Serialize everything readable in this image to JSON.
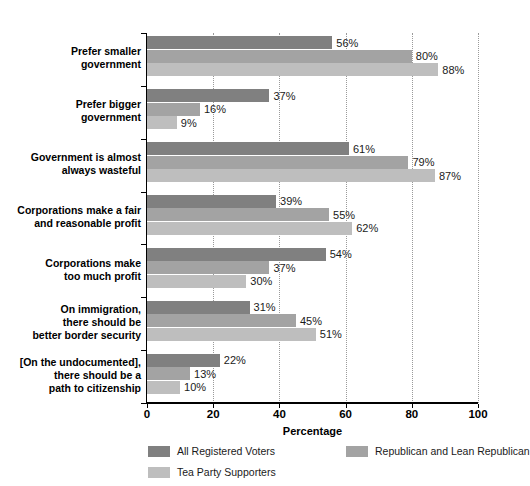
{
  "chart_data": {
    "type": "bar",
    "orientation": "horizontal",
    "grouped": true,
    "title": "",
    "xlabel": "Percentage",
    "ylabel": "",
    "xlim": [
      0,
      100
    ],
    "xticks": [
      0,
      20,
      40,
      60,
      80,
      100
    ],
    "grid": "vertical-dotted",
    "legend_position": "bottom",
    "value_label_suffix": "%",
    "categories": [
      "Prefer smaller government",
      "Prefer bigger government",
      "Government is almost always wasteful",
      "Corporations make a fair and reasonable profit",
      "Corporations make too much profit",
      "On immigration, there should be better border security",
      "[On the undocumented], there should be a path to citizenship"
    ],
    "category_lines": [
      [
        "Prefer smaller",
        "government"
      ],
      [
        "Prefer bigger",
        "government"
      ],
      [
        "Government is almost",
        "always wasteful"
      ],
      [
        "Corporations make a fair",
        "and reasonable profit"
      ],
      [
        "Corporations make",
        "too much profit"
      ],
      [
        "On immigration,",
        "there should be",
        "better border security"
      ],
      [
        "[On the undocumented],",
        "there should be a",
        "path to citizenship"
      ]
    ],
    "series": [
      {
        "name": "All Registered Voters",
        "color": "#808080",
        "values": [
          56,
          37,
          61,
          39,
          54,
          31,
          22
        ],
        "labels": [
          "56%",
          "37%",
          "61%",
          "39%",
          "54%",
          "31%",
          "22%"
        ]
      },
      {
        "name": "Republican and Lean Republican",
        "color": "#a3a3a3",
        "values": [
          80,
          16,
          79,
          55,
          37,
          45,
          13
        ],
        "labels": [
          "80%",
          "16%",
          "79%",
          "55%",
          "37%",
          "45%",
          "13%"
        ]
      },
      {
        "name": "Tea Party Supporters",
        "color": "#bebebe",
        "values": [
          88,
          9,
          87,
          62,
          30,
          51,
          10
        ],
        "labels": [
          "88%",
          "9%",
          "87%",
          "62%",
          "30%",
          "51%",
          "10%"
        ]
      }
    ]
  },
  "axis": {
    "tick_labels": [
      "0",
      "20",
      "40",
      "60",
      "80",
      "100"
    ],
    "title": "Percentage"
  },
  "legend": {
    "items": [
      {
        "label": "All Registered Voters",
        "color": "#808080"
      },
      {
        "label": "Republican and Lean Republican",
        "color": "#a3a3a3"
      },
      {
        "label": "Tea Party Supporters",
        "color": "#bebebe"
      }
    ]
  }
}
